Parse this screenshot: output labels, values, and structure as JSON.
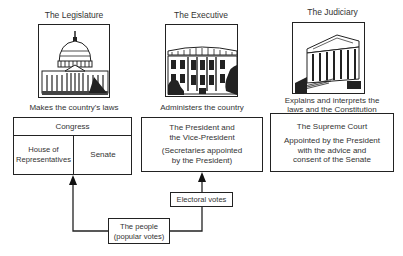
{
  "branches": [
    {
      "title": "The Legislature",
      "icon": "capitol-building-icon",
      "function": "Makes the country's laws",
      "body": {
        "header": "Congress",
        "chambers": [
          "House of Representatives",
          "Senate"
        ]
      }
    },
    {
      "title": "The Executive",
      "icon": "white-house-icon",
      "function": "Administers the country",
      "body": {
        "line1": "The President and",
        "line2": "the Vice-President",
        "note1": "(Secretaries appointed",
        "note2": "by the President)"
      }
    },
    {
      "title": "The Judiciary",
      "icon": "supreme-court-icon",
      "function_line1": "Explains and interprets the",
      "function_line2": "laws and the Constitution",
      "body": {
        "header": "The Supreme Court",
        "line1": "Appointed by the President",
        "line2": "with the advice and",
        "line3": "consent of the Senate"
      }
    }
  ],
  "flow": {
    "people_line1": "The people",
    "people_line2": "(popular votes)",
    "electoral": "Electoral votes"
  },
  "chambers_labels": {
    "house_line1": "House of",
    "house_line2": "Representatives",
    "senate": "Senate"
  }
}
